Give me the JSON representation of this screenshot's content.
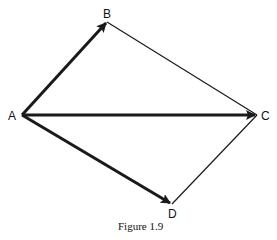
{
  "figure": {
    "caption": "Figure 1.9",
    "points": {
      "A": {
        "label": "A",
        "x": 22,
        "y": 115
      },
      "B": {
        "label": "B",
        "x": 107,
        "y": 22
      },
      "C": {
        "label": "C",
        "x": 257,
        "y": 115
      },
      "D": {
        "label": "D",
        "x": 172,
        "y": 204
      }
    },
    "vectors": [
      {
        "from": "A",
        "to": "B"
      },
      {
        "from": "A",
        "to": "C"
      },
      {
        "from": "A",
        "to": "D"
      }
    ],
    "edges": [
      {
        "from": "B",
        "to": "C"
      },
      {
        "from": "D",
        "to": "C"
      }
    ],
    "colors": {
      "stroke": "#1a1a1a",
      "background": "#ffffff"
    }
  }
}
